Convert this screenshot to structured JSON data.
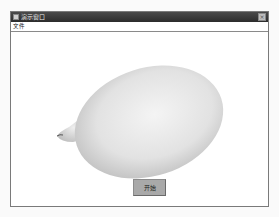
{
  "window": {
    "title": "演示窗口",
    "close_label": "×"
  },
  "menubar": {
    "items": [
      {
        "label": "文件"
      }
    ]
  },
  "canvas": {
    "object": "3d-rendered-ovoid-shape"
  },
  "actions": {
    "start_label": "开始"
  }
}
